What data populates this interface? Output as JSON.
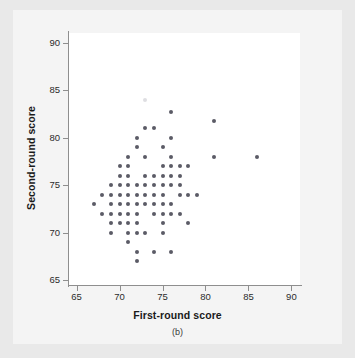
{
  "figure": {
    "panel_caption": "(b)",
    "point_color": "#5b5b66",
    "axis_color": "#8e8e8e",
    "background": "#e9e9e9",
    "plot_background": "#ffffff"
  },
  "chart_data": {
    "type": "scatter",
    "title": "",
    "xlabel": "First-round score",
    "ylabel": "Second-round score",
    "xlim": [
      64,
      91
    ],
    "ylim": [
      64.5,
      91
    ],
    "xticks": [
      65,
      70,
      75,
      80,
      85,
      90
    ],
    "yticks": [
      65,
      70,
      75,
      80,
      85,
      90
    ],
    "xtick_labels": [
      "65",
      "70",
      "75",
      "80",
      "85",
      "90"
    ],
    "ytick_labels": [
      "65",
      "70",
      "75",
      "80",
      "85",
      "90"
    ],
    "grid": false,
    "legend": false,
    "marker": "circle",
    "marker_size": 4,
    "points": [
      [
        67,
        73
      ],
      [
        68,
        74
      ],
      [
        68,
        72
      ],
      [
        69,
        75
      ],
      [
        69,
        74
      ],
      [
        69,
        73
      ],
      [
        69,
        72
      ],
      [
        69,
        71
      ],
      [
        69,
        70
      ],
      [
        70,
        77
      ],
      [
        70,
        76
      ],
      [
        70,
        75
      ],
      [
        70,
        74
      ],
      [
        70,
        73
      ],
      [
        70,
        72
      ],
      [
        70,
        71
      ],
      [
        71,
        78
      ],
      [
        71,
        77
      ],
      [
        71,
        76
      ],
      [
        71,
        75
      ],
      [
        71,
        74
      ],
      [
        71,
        73
      ],
      [
        71,
        72
      ],
      [
        71,
        71
      ],
      [
        71,
        70
      ],
      [
        71,
        69
      ],
      [
        72,
        80
      ],
      [
        72,
        79
      ],
      [
        72,
        75
      ],
      [
        72,
        74
      ],
      [
        72,
        73
      ],
      [
        72,
        72
      ],
      [
        72,
        71
      ],
      [
        72,
        70
      ],
      [
        72,
        68
      ],
      [
        72,
        67
      ],
      [
        73,
        81
      ],
      [
        73,
        78
      ],
      [
        73,
        76
      ],
      [
        73,
        75
      ],
      [
        73,
        74
      ],
      [
        73,
        73
      ],
      [
        73,
        70
      ],
      [
        74,
        81
      ],
      [
        74,
        76
      ],
      [
        74,
        75
      ],
      [
        74,
        74
      ],
      [
        74,
        73
      ],
      [
        74,
        72
      ],
      [
        74,
        68
      ],
      [
        75,
        79
      ],
      [
        75,
        77
      ],
      [
        75,
        76
      ],
      [
        75,
        75
      ],
      [
        75,
        74
      ],
      [
        75,
        73
      ],
      [
        75,
        72
      ],
      [
        75,
        71
      ],
      [
        75,
        70
      ],
      [
        76,
        82.7
      ],
      [
        76,
        80
      ],
      [
        76,
        78
      ],
      [
        76,
        77
      ],
      [
        76,
        76
      ],
      [
        76,
        75
      ],
      [
        76,
        73
      ],
      [
        76,
        72
      ],
      [
        76,
        68
      ],
      [
        77,
        77
      ],
      [
        77,
        76
      ],
      [
        77,
        75
      ],
      [
        77,
        74
      ],
      [
        77,
        72
      ],
      [
        78,
        77
      ],
      [
        78,
        74
      ],
      [
        78,
        71
      ],
      [
        79,
        74
      ],
      [
        81,
        81.7
      ],
      [
        81,
        78
      ],
      [
        86,
        78
      ],
      [
        73,
        84
      ]
    ],
    "faint_points": [
      [
        73,
        84
      ]
    ],
    "n_points": 79
  }
}
